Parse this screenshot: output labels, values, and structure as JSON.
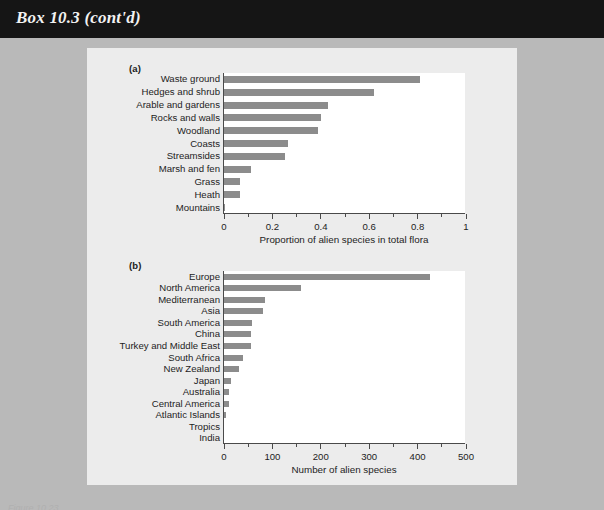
{
  "header": {
    "box_title": "Box 10.3 (cont'd)"
  },
  "footer": {
    "caption": "Figure 10.23"
  },
  "figures": [
    {
      "tag": "(a)",
      "xlabel": "Proportion of alien species in total flora",
      "ticks": [
        "0",
        "0.2",
        "0.4",
        "0.6",
        "0.8",
        "1"
      ]
    },
    {
      "tag": "(b)",
      "xlabel": "Number of alien species",
      "ticks": [
        "0",
        "100",
        "200",
        "300",
        "400",
        "500"
      ]
    }
  ],
  "chart_data": [
    {
      "type": "bar",
      "orientation": "horizontal",
      "panel": "(a)",
      "title": "",
      "xlabel": "Proportion of alien species in total flora",
      "ylabel": "",
      "xlim": [
        0,
        1
      ],
      "xticks": [
        0,
        0.2,
        0.4,
        0.6,
        0.8,
        1
      ],
      "xtick_labels": [
        "0",
        "0.2",
        "0.4",
        "0.6",
        "0.8",
        "1"
      ],
      "minor_tick_step": 0.1,
      "grid": false,
      "legend": false,
      "bar_color": "#8c8c8c",
      "categories": [
        "Waste ground",
        "Hedges and shrub",
        "Arable and gardens",
        "Rocks and walls",
        "Woodland",
        "Coasts",
        "Streamsides",
        "Marsh and fen",
        "Grass",
        "Heath",
        "Mountains"
      ],
      "values": [
        0.81,
        0.62,
        0.43,
        0.4,
        0.39,
        0.265,
        0.25,
        0.11,
        0.065,
        0.065,
        0.005
      ]
    },
    {
      "type": "bar",
      "orientation": "horizontal",
      "panel": "(b)",
      "title": "",
      "xlabel": "Number of alien species",
      "ylabel": "",
      "xlim": [
        0,
        500
      ],
      "xticks": [
        0,
        100,
        200,
        300,
        400,
        500
      ],
      "xtick_labels": [
        "0",
        "100",
        "200",
        "300",
        "400",
        "500"
      ],
      "minor_tick_step": 50,
      "grid": false,
      "legend": false,
      "bar_color": "#8c8c8c",
      "categories": [
        "Europe",
        "North America",
        "Mediterranean",
        "Asia",
        "South America",
        "China",
        "Turkey and Middle East",
        "South Africa",
        "New Zealand",
        "Japan",
        "Australia",
        "Central America",
        "Atlantic Islands",
        "Tropics",
        "India"
      ],
      "values": [
        425,
        160,
        85,
        80,
        58,
        55,
        55,
        40,
        30,
        15,
        10,
        10,
        4,
        0,
        0
      ]
    }
  ]
}
